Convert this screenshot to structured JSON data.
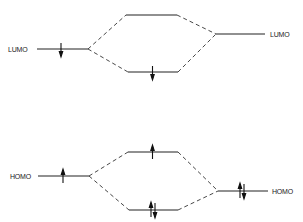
{
  "diagram": {
    "type": "molecular-orbital-interaction",
    "colors": {
      "line": "#222222",
      "background": "#ffffff"
    },
    "top": {
      "name": "LUMO-LUMO interaction",
      "left_label": "LUMO",
      "right_label": "LUMO",
      "left_level": {
        "electrons": "1 down"
      },
      "upper_combined_level": {
        "electrons": "0"
      },
      "lower_combined_level": {
        "electrons": "1 down"
      },
      "right_level": {
        "electrons": "0"
      }
    },
    "bottom": {
      "name": "HOMO-HOMO interaction",
      "left_label": "HOMO",
      "right_label": "HOMO",
      "left_level": {
        "electrons": "1 up"
      },
      "upper_combined_level": {
        "electrons": "1 up"
      },
      "lower_combined_level": {
        "electrons": "2 paired"
      },
      "right_level": {
        "electrons": "2 paired"
      }
    }
  }
}
